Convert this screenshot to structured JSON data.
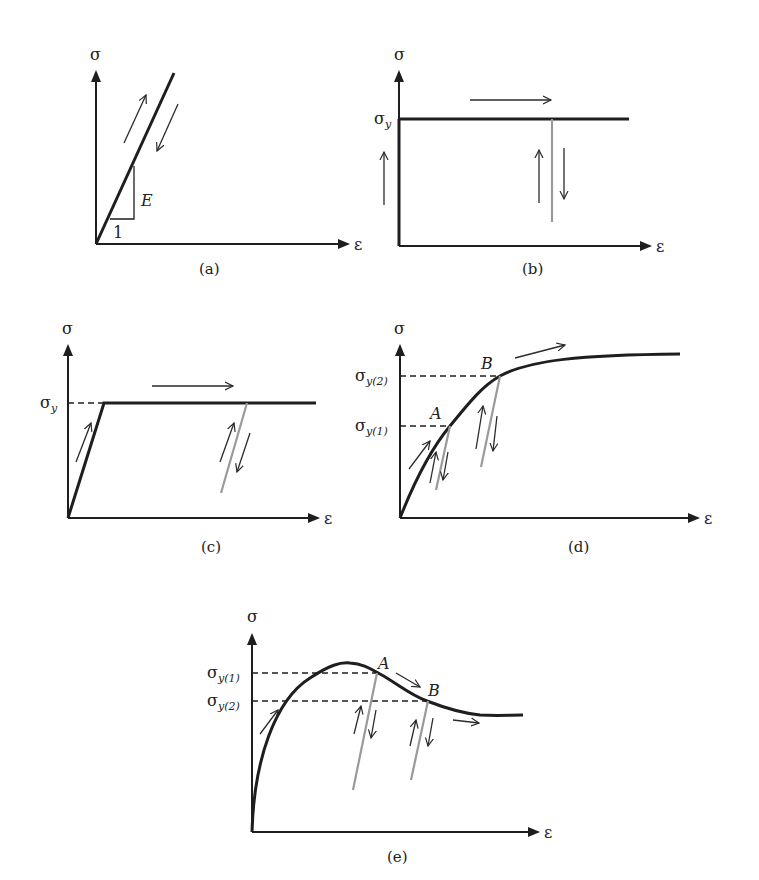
{
  "figure": {
    "axis_labels": {
      "y": "σ",
      "x": "ε"
    },
    "colors": {
      "main_curve": "#1e1e1e",
      "unload_line": "#9a9a9a",
      "arrows": "#2a2a2a"
    },
    "panels": [
      {
        "id": "a",
        "caption": "(a)",
        "description": "Linear elastic",
        "slope_label": "E",
        "run_label": "1"
      },
      {
        "id": "b",
        "caption": "(b)",
        "description": "Rigid perfectly plastic",
        "yield_label": {
          "base": "σ",
          "sub": "y"
        }
      },
      {
        "id": "c",
        "caption": "(c)",
        "description": "Elastic perfectly plastic",
        "yield_label": {
          "base": "σ",
          "sub": "y"
        }
      },
      {
        "id": "d",
        "caption": "(d)",
        "description": "Elastic-plastic with strain hardening",
        "yield_labels": [
          {
            "base": "σ",
            "sub": "y(2)"
          },
          {
            "base": "σ",
            "sub": "y(1)"
          }
        ],
        "points": [
          "A",
          "B"
        ]
      },
      {
        "id": "e",
        "caption": "(e)",
        "description": "Elastic-plastic with strain softening",
        "yield_labels": [
          {
            "base": "σ",
            "sub": "y(1)"
          },
          {
            "base": "σ",
            "sub": "y(2)"
          }
        ],
        "points": [
          "A",
          "B"
        ]
      }
    ]
  }
}
